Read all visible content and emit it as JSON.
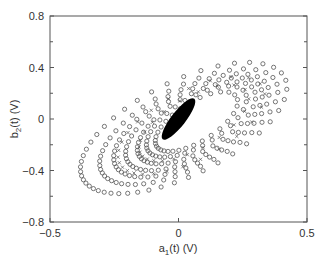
{
  "chart_data": {
    "type": "scatter",
    "title": "",
    "xlabel": "a1(t) (V)",
    "xlabel_main": "a",
    "xlabel_sub": "1",
    "xlabel_rest": "(t) (V)",
    "ylabel": "b2(t) (V)",
    "ylabel_main": "b",
    "ylabel_sub": "2",
    "ylabel_rest": "(t) (V)",
    "xlim": [
      -0.5,
      0.5
    ],
    "ylim": [
      -0.8,
      0.8
    ],
    "xticks": [
      -0.5,
      0,
      0.5
    ],
    "xtick_labels": [
      "−0.5",
      "0",
      "0.5"
    ],
    "yticks": [
      0.8,
      0.4,
      0,
      -0.4,
      -0.8
    ],
    "ytick_labels": [
      "0.8",
      "0.4",
      "0",
      "−0.4",
      "−0.8"
    ],
    "grid": false,
    "legend": null,
    "marker_color": "#555555",
    "core_color": "#000000",
    "series": [
      {
        "name": "trajectory loops (circles)",
        "marker": "o",
        "loops": [
          {
            "cx": 0.02,
            "cy": -0.07,
            "rx": 0.47,
            "ry": 0.22,
            "angle_deg": 36,
            "n": 46
          },
          {
            "cx": 0.04,
            "cy": -0.06,
            "rx": 0.41,
            "ry": 0.19,
            "angle_deg": 37,
            "n": 44
          },
          {
            "cx": 0.05,
            "cy": -0.05,
            "rx": 0.36,
            "ry": 0.17,
            "angle_deg": 38,
            "n": 42
          },
          {
            "cx": 0.06,
            "cy": -0.04,
            "rx": 0.32,
            "ry": 0.15,
            "angle_deg": 39,
            "n": 40
          },
          {
            "cx": 0.07,
            "cy": -0.03,
            "rx": 0.28,
            "ry": 0.13,
            "angle_deg": 40,
            "n": 38
          },
          {
            "cx": 0.07,
            "cy": -0.02,
            "rx": 0.24,
            "ry": 0.11,
            "angle_deg": 41,
            "n": 34
          },
          {
            "cx": 0.07,
            "cy": -0.02,
            "rx": 0.2,
            "ry": 0.09,
            "angle_deg": 42,
            "n": 30
          }
        ]
      },
      {
        "name": "trajectory loops (crosses)",
        "marker": "x",
        "loops": [
          {
            "cx": 0.05,
            "cy": -0.05,
            "rx": 0.34,
            "ry": 0.16,
            "angle_deg": 38,
            "n": 26
          },
          {
            "cx": 0.06,
            "cy": -0.03,
            "rx": 0.26,
            "ry": 0.12,
            "angle_deg": 40,
            "n": 22
          }
        ]
      },
      {
        "name": "steady-state core",
        "marker": "filled-ellipse",
        "cx": 0.0,
        "cy": 0.0,
        "rx": 0.1,
        "ry": 0.028,
        "angle_deg": 52
      }
    ]
  }
}
